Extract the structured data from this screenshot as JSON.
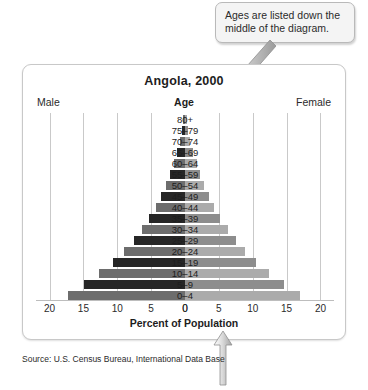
{
  "callout": {
    "text": "Ages are listed down the middle of the diagram.",
    "arrow_name": "callout-pointer-arrow"
  },
  "bottom_annotation": {
    "arrow_name": "axis-pointer-arrow"
  },
  "panel": {
    "title": "Angola, 2000",
    "male_label": "Male",
    "age_label": "Age",
    "female_label": "Female",
    "axis_title": "Percent of Population",
    "source": "Source: U.S. Census Bureau, International Data Base"
  },
  "colors": {
    "male_dark": "#262626",
    "male_light": "#6d6d6d",
    "female_dark": "#8d8d8d",
    "female_light": "#ababab",
    "gridline": "#c9c9c9",
    "panel_border": "#c8c8c8",
    "callout_bg": "#f4f4f4",
    "callout_border": "#b9b9b9",
    "text": "#231f20"
  },
  "chart_data": {
    "type": "bar",
    "subtype": "population-pyramid",
    "title": "Angola, 2000",
    "xlabel": "Percent of Population",
    "ylabel": "Age",
    "xlim": [
      0,
      22
    ],
    "grid": true,
    "legend": "none",
    "tick_values": [
      20,
      15,
      10,
      5,
      0,
      0,
      5,
      10,
      15,
      20
    ],
    "tick_labels": [
      "20",
      "15",
      "10",
      "5",
      "0",
      "0",
      "5",
      "10",
      "15",
      "20"
    ],
    "categories": [
      "80+",
      "75–79",
      "70–74",
      "65–69",
      "60–64",
      "55–59",
      "50–54",
      "45–49",
      "40–44",
      "35–39",
      "30–34",
      "25–29",
      "20–24",
      "15–19",
      "10–14",
      "5–9",
      "0–4"
    ],
    "series": [
      {
        "name": "Male",
        "side": "left",
        "values": [
          0.3,
          0.5,
          0.8,
          1.2,
          1.7,
          2.2,
          2.8,
          3.5,
          4.3,
          5.3,
          6.4,
          7.6,
          9.0,
          10.7,
          12.7,
          14.9,
          17.3
        ]
      },
      {
        "name": "Female",
        "side": "right",
        "values": [
          0.3,
          0.5,
          0.8,
          1.2,
          1.7,
          2.2,
          2.8,
          3.5,
          4.3,
          5.2,
          6.3,
          7.5,
          8.9,
          10.5,
          12.4,
          14.6,
          17.0
        ]
      }
    ]
  }
}
